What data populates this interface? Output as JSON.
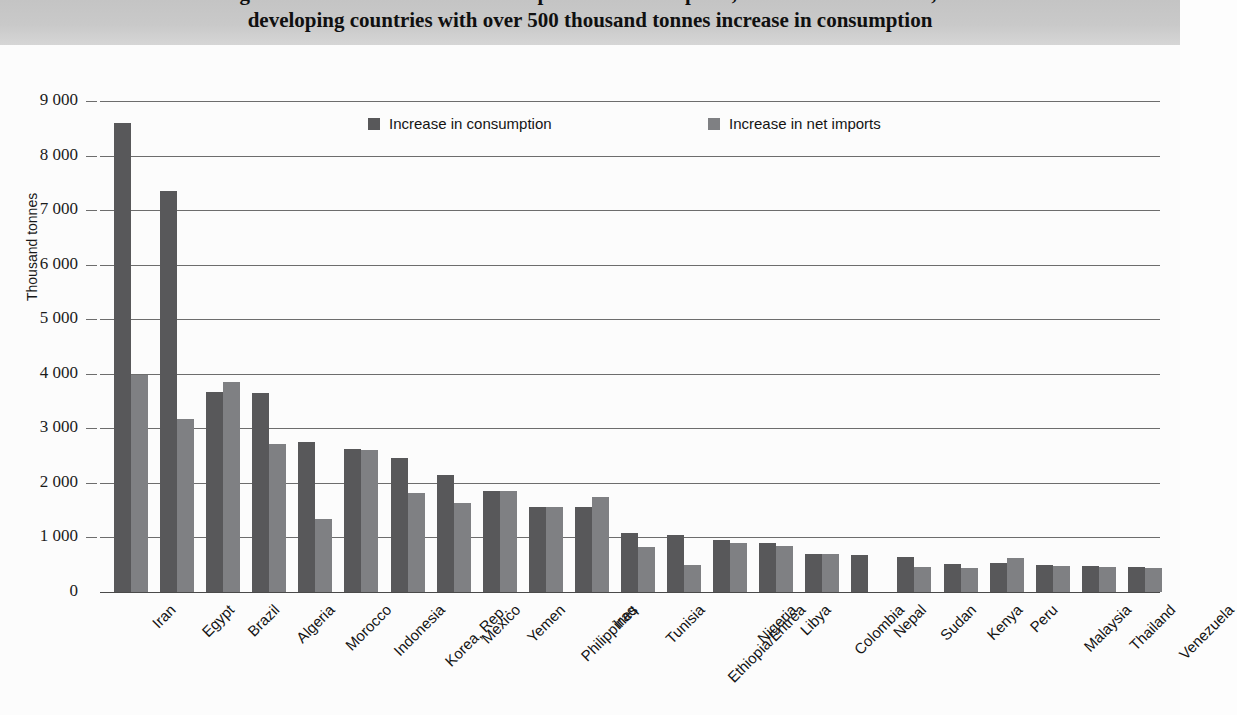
{
  "title": {
    "line1": "Figure 2. Increase in wheat consumption and net imports, 1979-81 to 1999-2001, in",
    "line2": "developing countries with over 500 thousand tonnes increase in consumption"
  },
  "axis": {
    "ylabel": "Thousand tonnes",
    "yticks": [
      "9 000",
      "8 000",
      "7 000",
      "6 000",
      "5 000",
      "4 000",
      "3 000",
      "2 000",
      "1 000",
      "0"
    ],
    "ytick_values": [
      9000,
      8000,
      7000,
      6000,
      5000,
      4000,
      3000,
      2000,
      1000,
      0
    ]
  },
  "legend": {
    "items": [
      {
        "label": "Increase in consumption",
        "color": "#58585a"
      },
      {
        "label": "Increase in net imports",
        "color": "#7f8083"
      }
    ]
  },
  "colors": {
    "consumption": "#58585a",
    "net_imports": "#7f8083",
    "title_band": "#c9c9c9",
    "gridline": "#6d6d6d",
    "plot_background": "#fcfcfc"
  },
  "chart_data": {
    "type": "bar",
    "title": "Figure 2. Increase in wheat consumption and net imports, 1979-81 to 1999-2001, in developing countries with over 500 thousand tonnes increase in consumption",
    "xlabel": "",
    "ylabel": "Thousand tonnes",
    "ylim": [
      0,
      9000
    ],
    "ytick_step": 1000,
    "grid": true,
    "legend_position": "top-center",
    "categories": [
      "Iran",
      "Egypt",
      "Brazil",
      "Algeria",
      "Morocco",
      "Indonesia",
      "Korea, Rep.",
      "Mexico",
      "Yemen",
      "Philippines",
      "Iraq",
      "Tunisia",
      "Ethiopia/Eritrea",
      "Nigeria",
      "Libya",
      "Colombia",
      "Nepal",
      "Sudan",
      "Kenya",
      "Peru",
      "Malaysia",
      "Thailand",
      "Venezuela"
    ],
    "series": [
      {
        "name": "Increase in consumption",
        "color": "#58585a",
        "values": [
          8600,
          7350,
          3670,
          3640,
          2750,
          2620,
          2460,
          2140,
          1850,
          1555,
          1550,
          1090,
          1050,
          960,
          890,
          700,
          680,
          650,
          520,
          540,
          490,
          480,
          450
        ]
      },
      {
        "name": "Increase in net imports",
        "color": "#7f8083",
        "values": [
          3980,
          3170,
          3850,
          2720,
          1340,
          2600,
          1820,
          1640,
          1855,
          1550,
          1750,
          820,
          500,
          890,
          835,
          690,
          0,
          455,
          440,
          615,
          475,
          465,
          435
        ]
      }
    ]
  }
}
